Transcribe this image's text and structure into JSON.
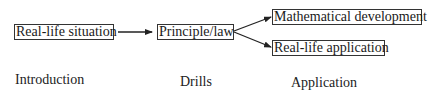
{
  "diagram": {
    "nodes": [
      {
        "id": "real-life-situation",
        "label": "Real-life situation"
      },
      {
        "id": "principle-law",
        "label": "Principle/law"
      },
      {
        "id": "mathematical-development",
        "label": "Mathematical development"
      },
      {
        "id": "real-life-application",
        "label": "Real-life application"
      }
    ],
    "edges": [
      {
        "from": "real-life-situation",
        "to": "principle-law"
      },
      {
        "from": "principle-law",
        "to": "mathematical-development"
      },
      {
        "from": "principle-law",
        "to": "real-life-application"
      }
    ],
    "stages": [
      {
        "label": "Introduction"
      },
      {
        "label": "Drills"
      },
      {
        "label": "Application"
      }
    ],
    "colors": {
      "line": "#222222",
      "box_border": "#333333",
      "text": "#1a1a1a",
      "background": "#ffffff"
    }
  }
}
